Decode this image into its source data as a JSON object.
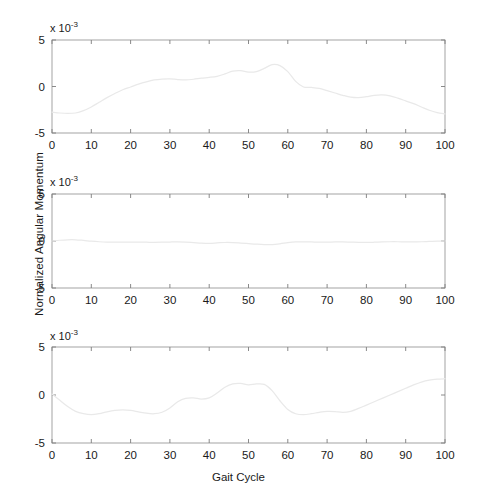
{
  "figure": {
    "background_color": "#ffffff",
    "axis_color": "#9a9a9a",
    "curve_color": "#e9e9e9",
    "text_color": "#1a1a1a",
    "ylabel": "Normalized Angular Momentum",
    "xlabel": "Gait Cycle",
    "exponent_label_prefix": "x 10",
    "exponent_label_power": "-3"
  },
  "axes": {
    "xticks": [
      "0",
      "10",
      "20",
      "30",
      "40",
      "50",
      "60",
      "70",
      "80",
      "90",
      "100"
    ],
    "xtick_values": [
      0,
      10,
      20,
      30,
      40,
      50,
      60,
      70,
      80,
      90,
      100
    ],
    "yticks": [
      "5",
      "0",
      "-5"
    ],
    "ytick_values": [
      5,
      0,
      -5
    ],
    "xlim": [
      0,
      100
    ],
    "ylim": [
      -5,
      5
    ]
  },
  "chart_data": {
    "type": "line",
    "title": "",
    "xlabel": "Gait Cycle",
    "ylabel": "Normalized Angular Momentum",
    "y_multiplier": "x 10^-3",
    "xlim": [
      0,
      100
    ],
    "ylim": [
      -5,
      5
    ],
    "grid": false,
    "legend": "none",
    "panels": [
      {
        "name": "panel-top",
        "index": 1,
        "x": [
          0,
          2,
          4,
          6,
          8,
          10,
          12,
          14,
          16,
          18,
          20,
          22,
          24,
          26,
          28,
          30,
          32,
          34,
          36,
          38,
          40,
          42,
          44,
          46,
          48,
          50,
          52,
          54,
          56,
          58,
          60,
          62,
          64,
          66,
          68,
          70,
          72,
          74,
          76,
          78,
          80,
          82,
          84,
          86,
          88,
          90,
          92,
          94,
          96,
          98,
          100
        ],
        "y": [
          -2.75,
          -2.85,
          -2.9,
          -2.85,
          -2.6,
          -2.2,
          -1.7,
          -1.2,
          -0.75,
          -0.35,
          -0.05,
          0.25,
          0.5,
          0.7,
          0.8,
          0.82,
          0.75,
          0.72,
          0.78,
          0.9,
          0.98,
          1.1,
          1.35,
          1.65,
          1.7,
          1.55,
          1.6,
          1.95,
          2.35,
          2.25,
          1.6,
          0.55,
          -0.05,
          -0.1,
          -0.2,
          -0.45,
          -0.7,
          -0.95,
          -1.15,
          -1.2,
          -1.1,
          -0.95,
          -0.9,
          -1.0,
          -1.25,
          -1.55,
          -1.85,
          -2.2,
          -2.55,
          -2.8,
          -2.95
        ]
      },
      {
        "name": "panel-middle",
        "index": 2,
        "x": [
          0,
          2,
          4,
          6,
          8,
          10,
          12,
          14,
          16,
          18,
          20,
          22,
          24,
          26,
          28,
          30,
          32,
          34,
          36,
          38,
          40,
          42,
          44,
          46,
          48,
          50,
          52,
          54,
          56,
          58,
          60,
          62,
          64,
          66,
          68,
          70,
          72,
          74,
          76,
          78,
          80,
          82,
          84,
          86,
          88,
          90,
          92,
          94,
          96,
          98,
          100
        ],
        "y": [
          0.0,
          0.08,
          0.13,
          0.13,
          0.06,
          -0.02,
          -0.08,
          -0.12,
          -0.13,
          -0.13,
          -0.12,
          -0.12,
          -0.13,
          -0.14,
          -0.13,
          -0.11,
          -0.1,
          -0.12,
          -0.17,
          -0.22,
          -0.24,
          -0.2,
          -0.16,
          -0.17,
          -0.22,
          -0.28,
          -0.34,
          -0.38,
          -0.38,
          -0.3,
          -0.18,
          -0.1,
          -0.08,
          -0.1,
          -0.12,
          -0.12,
          -0.1,
          -0.1,
          -0.12,
          -0.14,
          -0.15,
          -0.13,
          -0.1,
          -0.08,
          -0.08,
          -0.1,
          -0.1,
          -0.08,
          -0.05,
          -0.02,
          0.0
        ]
      },
      {
        "name": "panel-bottom",
        "index": 3,
        "x": [
          0,
          2,
          4,
          6,
          8,
          10,
          12,
          14,
          16,
          18,
          20,
          22,
          24,
          26,
          28,
          30,
          32,
          34,
          36,
          38,
          40,
          42,
          44,
          46,
          48,
          50,
          52,
          54,
          56,
          58,
          60,
          62,
          64,
          66,
          68,
          70,
          72,
          74,
          76,
          78,
          80,
          82,
          84,
          86,
          88,
          90,
          92,
          94,
          96,
          98,
          100
        ],
        "y": [
          0.1,
          -0.55,
          -1.2,
          -1.7,
          -1.95,
          -2.05,
          -1.95,
          -1.75,
          -1.6,
          -1.55,
          -1.6,
          -1.75,
          -1.9,
          -1.95,
          -1.8,
          -1.35,
          -0.7,
          -0.35,
          -0.3,
          -0.42,
          -0.3,
          0.2,
          0.8,
          1.15,
          1.2,
          1.05,
          1.15,
          1.1,
          0.45,
          -0.6,
          -1.5,
          -1.95,
          -2.05,
          -1.95,
          -1.8,
          -1.7,
          -1.72,
          -1.8,
          -1.7,
          -1.4,
          -1.05,
          -0.7,
          -0.35,
          0.0,
          0.35,
          0.7,
          1.05,
          1.35,
          1.55,
          1.65,
          1.7
        ]
      }
    ]
  }
}
